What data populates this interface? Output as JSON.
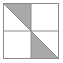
{
  "figure": {
    "name": "quartered-square-diagonal-shading",
    "canvas": {
      "width": 63,
      "height": 63,
      "background": "#ffffff"
    },
    "square": {
      "x": 3.5,
      "y": 3.5,
      "size": 55,
      "stroke_color": "#8a8a8a",
      "stroke_width": 1,
      "fill": "#ffffff"
    },
    "grid": {
      "stroke_color": "#8a8a8a",
      "stroke_width": 1,
      "vertical_x": 31,
      "horizontal_y": 31,
      "rows": 2,
      "columns": 2
    },
    "diagonal": {
      "stroke_color": "#8a8a8a",
      "stroke_width": 1,
      "from": "top-left",
      "to": "bottom-right"
    },
    "shade_color": "#a9a9a9",
    "quadrants": [
      {
        "name": "top-left",
        "position": "top-left",
        "shaded": true,
        "shaded_half": "upper-right-triangle",
        "points": "3.5,3.5 31,3.5 31,31",
        "fill": "#a9a9a9"
      },
      {
        "name": "top-right",
        "position": "top-right",
        "shaded": false,
        "shaded_half": "none",
        "points": "",
        "fill": "#ffffff"
      },
      {
        "name": "bottom-left",
        "position": "bottom-left",
        "shaded": false,
        "shaded_half": "none",
        "points": "",
        "fill": "#ffffff"
      },
      {
        "name": "bottom-right",
        "position": "bottom-right",
        "shaded": true,
        "shaded_half": "lower-left-triangle",
        "points": "31,31 31,58.5 58.5,58.5",
        "fill": "#a9a9a9"
      }
    ],
    "shaded_fraction": {
      "numerator": 1,
      "denominator": 4
    }
  }
}
